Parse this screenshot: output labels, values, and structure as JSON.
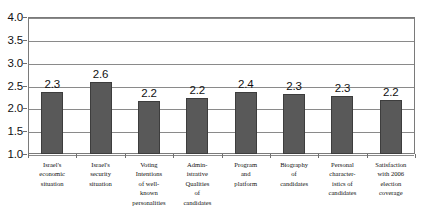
{
  "chart_data": {
    "type": "bar",
    "title": "",
    "subtitle": "",
    "xlabel": "",
    "ylabel": "",
    "ylim": [
      1.0,
      4.0
    ],
    "ytick_labels": [
      "4.0",
      "3.5",
      "3.0",
      "2.5",
      "2.0",
      "1.5",
      "1.0"
    ],
    "ytick_values": [
      4.0,
      3.5,
      3.0,
      2.5,
      2.0,
      1.5,
      1.0
    ],
    "grid": true,
    "legend": false,
    "legend_position": "none",
    "bar_color": "#595959",
    "bar_border_color": "#3d3d3d",
    "gridline_color": "#8a8a8a",
    "categories": [
      "Israel's economic situation",
      "Israel's security situation",
      "Voting Intentions of well-known personalities",
      "Admin-istrative Qualities of candidates",
      "Program and platform",
      "Biography of candidates",
      "Personal character-istics of candidates",
      "Satisfaction with 2006 election coverage"
    ],
    "category_label_lines": [
      [
        "Israel's",
        "economic",
        "situation"
      ],
      [
        "Israel's",
        "security",
        "situation"
      ],
      [
        "Voting",
        "Intentions",
        "of well-",
        "known",
        "personalities"
      ],
      [
        "Admin-",
        "istrative",
        "Qualities",
        "of",
        "candidates"
      ],
      [
        "Program",
        "and",
        "platform"
      ],
      [
        "Biography",
        "of",
        "candidates"
      ],
      [
        "Personal",
        "character-",
        "istics of",
        "candidates"
      ],
      [
        "Satisfaction",
        "with 2006",
        "election",
        "coverage"
      ]
    ],
    "values": [
      2.3,
      2.6,
      2.2,
      2.2,
      2.4,
      2.3,
      2.3,
      2.2
    ],
    "value_labels": [
      "2.3",
      "2.6",
      "2.2",
      "2.2",
      "2.4",
      "2.3",
      "2.3",
      "2.2"
    ],
    "bar_tops": [
      2.35,
      2.58,
      2.16,
      2.22,
      2.35,
      2.32,
      2.28,
      2.18
    ]
  }
}
